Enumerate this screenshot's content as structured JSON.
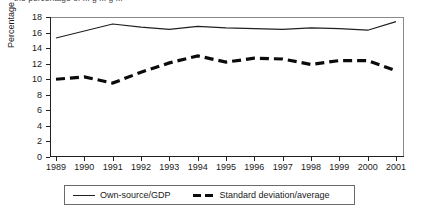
{
  "caption": {
    "clipped_text": "the percentage of ... g ... g ..."
  },
  "chart_data": {
    "type": "line",
    "title": "",
    "xlabel": "",
    "ylabel": "Percentage",
    "ylim": [
      0,
      18
    ],
    "ytick_step": 2,
    "yticks": [
      18,
      16,
      14,
      12,
      10,
      8,
      6,
      4,
      2,
      0
    ],
    "grid": false,
    "legend_position": "bottom",
    "categories": [
      "1989",
      "1990",
      "1991",
      "1992",
      "1993",
      "1994",
      "1995",
      "1996",
      "1997",
      "1998",
      "1999",
      "2000",
      "2001"
    ],
    "series": [
      {
        "name": "Own-source/GDP",
        "style": "solid",
        "color": "#202020",
        "values": [
          15.3,
          16.2,
          17.1,
          16.7,
          16.4,
          16.8,
          16.6,
          16.5,
          16.4,
          16.6,
          16.5,
          16.3,
          17.4
        ]
      },
      {
        "name": "Standard deviation/average",
        "style": "dashed",
        "color": "#0b0b0b",
        "values": [
          10.0,
          10.3,
          9.5,
          10.9,
          12.1,
          13.0,
          12.2,
          12.7,
          12.6,
          11.9,
          12.4,
          12.4,
          11.1
        ]
      }
    ]
  },
  "legend": {
    "entries": [
      {
        "label": "Own-source/GDP"
      },
      {
        "label": "Standard deviation/average"
      }
    ]
  },
  "axis": {
    "y_label": "Percentage"
  }
}
